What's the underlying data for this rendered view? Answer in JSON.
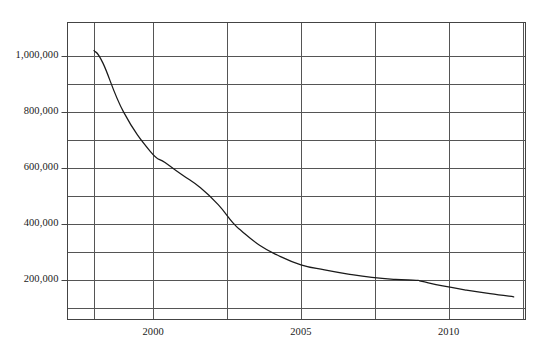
{
  "chart_data": {
    "type": "line",
    "title": "",
    "subtitle": "",
    "xlabel": "",
    "ylabel": "",
    "xlim": [
      1997.1,
      2012.6
    ],
    "ylim": [
      60000,
      1120000
    ],
    "grid": true,
    "legend": null,
    "x_ticks_major": [
      2000,
      2005,
      2010
    ],
    "x_tick_labels": [
      "2000",
      "2005",
      "2010"
    ],
    "x_gridlines": [
      1998,
      2000,
      2002.5,
      2005,
      2007.5,
      2010,
      2012.5
    ],
    "y_ticks_major": [
      200000,
      400000,
      600000,
      800000,
      1000000
    ],
    "y_tick_labels": [
      "200,000",
      "400,000",
      "600,000",
      "800,000",
      "1,000,000"
    ],
    "y_gridlines_minor": [
      100000,
      300000,
      500000,
      700000,
      900000
    ],
    "line_color": "#1a1a1a",
    "grid_color": "#555555",
    "axis_color": "#444444",
    "series": [
      {
        "name": "series-1",
        "x": [
          1998.0,
          1998.3,
          1999.0,
          1999.9,
          2000.4,
          2001.0,
          2001.6,
          2002.2,
          2002.7,
          2003.0,
          2003.6,
          2004.2,
          2005.0,
          2005.8,
          2006.6,
          2007.4,
          2008.2,
          2008.9,
          2009.1,
          2009.8,
          2010.6,
          2011.4,
          2012.2
        ],
        "y": [
          1020000,
          975000,
          800000,
          660000,
          620000,
          575000,
          530000,
          470000,
          405000,
          375000,
          325000,
          290000,
          255000,
          237000,
          222000,
          210000,
          203000,
          200000,
          196000,
          180000,
          165000,
          152000,
          141000
        ]
      }
    ]
  },
  "axes": {
    "y_labels": [
      "1,000,000",
      "800,000",
      "600,000",
      "400,000",
      "200,000"
    ],
    "x_labels": [
      "2000",
      "2005",
      "2010"
    ]
  }
}
